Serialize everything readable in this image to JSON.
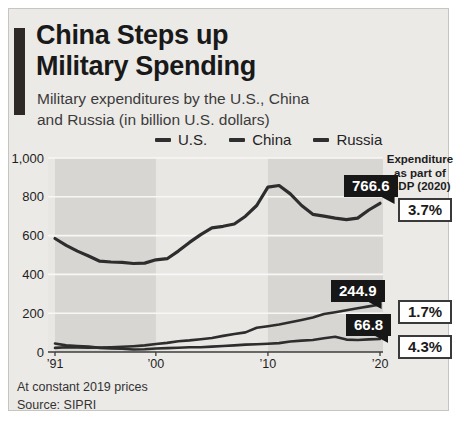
{
  "header": {
    "title_lines": "China Steps up\nMilitary Spending",
    "subtitle_lines": "Military expenditures by the U.S., China\nand Russia (in billion U.S. dollars)"
  },
  "legend": {
    "items": [
      {
        "label": "U.S."
      },
      {
        "label": "China"
      },
      {
        "label": "Russia"
      }
    ],
    "marker_color": "#2f2f2f"
  },
  "gdp_panel": {
    "header": "Expenditure\nas part of\nGDP (2020)",
    "values": [
      {
        "series": "U.S.",
        "value": "3.7%"
      },
      {
        "series": "China",
        "value": "1.7%"
      },
      {
        "series": "Russia",
        "value": "4.3%"
      }
    ]
  },
  "footer": {
    "note": "At constant 2019 prices",
    "source": "Source: SIPRI"
  },
  "chart_data": {
    "type": "line",
    "title": "China Steps up Military Spending",
    "subtitle": "Military expenditures by the U.S., China and Russia (in billion U.S. dollars)",
    "x": [
      1991,
      1992,
      1993,
      1994,
      1995,
      1996,
      1997,
      1998,
      1999,
      2000,
      2001,
      2002,
      2003,
      2004,
      2005,
      2006,
      2007,
      2008,
      2009,
      2010,
      2011,
      2012,
      2013,
      2014,
      2015,
      2016,
      2017,
      2018,
      2019,
      2020
    ],
    "series": [
      {
        "name": "U.S.",
        "values": [
          585,
          550,
          520,
          495,
          468,
          464,
          462,
          456,
          458,
          475,
          481,
          520,
          565,
          605,
          640,
          648,
          660,
          700,
          755,
          850,
          858,
          815,
          755,
          710,
          700,
          690,
          682,
          690,
          732,
          766.6
        ],
        "end_label": "766.6",
        "gdp_share_2020": "3.7%"
      },
      {
        "name": "China",
        "values": [
          21,
          24,
          23,
          22,
          23,
          25,
          27,
          30,
          34,
          41,
          47,
          55,
          60,
          66,
          72,
          83,
          93,
          101,
          125,
          133,
          142,
          153,
          165,
          178,
          196,
          205,
          215,
          225,
          235,
          244.9
        ],
        "end_label": "244.9",
        "gdp_share_2020": "1.7%"
      },
      {
        "name": "Russia",
        "values": [
          44,
          34,
          31,
          28,
          21,
          18,
          17,
          13,
          14,
          18,
          20,
          22,
          24,
          25,
          28,
          31,
          34,
          38,
          40,
          43,
          46,
          54,
          59,
          62,
          71,
          79,
          64,
          62,
          65,
          66.8
        ],
        "end_label": "66.8",
        "gdp_share_2020": "4.3%"
      }
    ],
    "ylim": [
      0,
      1000
    ],
    "yticks": [
      {
        "value": 0,
        "label": "0"
      },
      {
        "value": 200,
        "label": "200"
      },
      {
        "value": 400,
        "label": "400"
      },
      {
        "value": 600,
        "label": "600"
      },
      {
        "value": 800,
        "label": "800"
      },
      {
        "value": 1000,
        "label": "1,000"
      }
    ],
    "xticks": [
      {
        "year": 1991,
        "label": "’91"
      },
      {
        "year": 2000,
        "label": "’00"
      },
      {
        "year": 2010,
        "label": "’10"
      },
      {
        "year": 2020,
        "label": "’20"
      }
    ],
    "decade_bands": [
      {
        "from": 1991,
        "to": 2000
      },
      {
        "from": 2010,
        "to": 2020
      }
    ],
    "grid": true,
    "legend_position": "top-center",
    "colors": {
      "line": "#2d2d2d",
      "plot_bg": "#e9e7e4",
      "band": "#d8d6d3",
      "grid": "#f8f7f5",
      "axis": "#3c3c3c",
      "label_box_bg": "#171717",
      "label_box_text": "#ffffff",
      "accent_bar": "#2e2827"
    },
    "footnote": "At constant 2019 prices",
    "source": "Source: SIPRI"
  }
}
